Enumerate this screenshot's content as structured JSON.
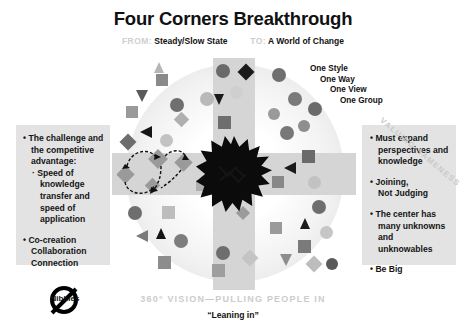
{
  "header": {
    "title": "Four Corners Breakthrough",
    "from_label": "FROM:",
    "from_value": "Steady/Slow State",
    "to_label": "TO:",
    "to_value": "A World of Change"
  },
  "left_panel": {
    "items": [
      {
        "bullet": "•",
        "lines": [
          "The challenge and",
          "the competitive",
          "advantage:"
        ],
        "sub_bullet": "·",
        "sub_lines": [
          "Speed of",
          "knowledge",
          "transfer and",
          "speed of",
          "application"
        ]
      },
      {
        "bullet": "•",
        "lines": [
          "Co-creation",
          "Collaboration",
          "Connection"
        ],
        "sub_bullet": "",
        "sub_lines": []
      }
    ]
  },
  "right_panel": {
    "items": [
      {
        "bullet": "•",
        "lines": [
          "Must expand",
          "perspectives and",
          "knowledge"
        ]
      },
      {
        "bullet": "•",
        "lines": [
          "Joining,",
          "Not Judging"
        ]
      },
      {
        "bullet": "•",
        "lines": [
          "The center has",
          "many unknowns",
          "and unknowables"
        ]
      },
      {
        "bullet": "•",
        "lines": [
          "Be Big"
        ]
      }
    ]
  },
  "diagram": {
    "diagonal_label": "VALUING SAMENESS",
    "one_list": [
      "One Style",
      "One Way",
      "One View",
      "One Group"
    ],
    "center_icon": "starburst-explosion",
    "arrow_count": 8,
    "arrow_direction": "inward"
  },
  "footer": {
    "main": "360° VISION—PULLING PEOPLE IN",
    "sub": "“Leaning in”"
  },
  "badge": {
    "label": "Nibbles",
    "icon": "no-entry-prohibition-icon"
  },
  "colors": {
    "panel_bg": "#e3e3e3",
    "band": "#d5d5d5",
    "muted_text": "#cccccc",
    "ink": "#111111",
    "shape_dark": "#555555",
    "shape_mid": "#888888",
    "shape_light": "#bbbbbb",
    "black": "#000000"
  },
  "shapes": [
    {
      "t": "sq",
      "x": 44,
      "y": 16,
      "s": 12,
      "c": "#8a8a8a"
    },
    {
      "t": "tri",
      "x": 24,
      "y": 32,
      "s": 12,
      "c": "#5a5a5a"
    },
    {
      "t": "ci",
      "x": 58,
      "y": 40,
      "s": 14,
      "c": "#6f6f6f"
    },
    {
      "t": "ci",
      "x": 88,
      "y": 34,
      "s": 14,
      "c": "#b9b9b9"
    },
    {
      "t": "dia",
      "x": 64,
      "y": 56,
      "s": 11,
      "c": "#b0b0b0"
    },
    {
      "t": "tri",
      "x": 28,
      "y": 68,
      "s": 12,
      "c": "#151515"
    },
    {
      "t": "dia",
      "x": 10,
      "y": 78,
      "s": 12,
      "c": "#6d6d6d"
    },
    {
      "t": "sq",
      "x": 14,
      "y": 48,
      "s": 12,
      "c": "#9a9a9a"
    },
    {
      "t": "ci",
      "x": 48,
      "y": 76,
      "s": 13,
      "c": "#c2c2c2"
    },
    {
      "t": "tri",
      "x": 42,
      "y": 4,
      "s": 11,
      "c": "#b6b6b6"
    },
    {
      "t": "ci",
      "x": 104,
      "y": 6,
      "s": 14,
      "c": "#6a6a6a"
    },
    {
      "t": "dia",
      "x": 128,
      "y": 8,
      "s": 12,
      "c": "#1a1a1a"
    },
    {
      "t": "tri",
      "x": 102,
      "y": 36,
      "s": 11,
      "c": "#1b1b1b"
    },
    {
      "t": "ci",
      "x": 118,
      "y": 28,
      "s": 13,
      "c": "#cfcfcf"
    },
    {
      "t": "sq",
      "x": 106,
      "y": 58,
      "s": 13,
      "c": "#6e6e6e"
    },
    {
      "t": "ci",
      "x": 160,
      "y": 10,
      "s": 14,
      "c": "#6f6f6f"
    },
    {
      "t": "ci",
      "x": 176,
      "y": 34,
      "s": 14,
      "c": "#7a7a7a"
    },
    {
      "t": "ci",
      "x": 196,
      "y": 44,
      "s": 14,
      "c": "#6a6a6a"
    },
    {
      "t": "ci",
      "x": 156,
      "y": 50,
      "s": 12,
      "c": "#9a9a9a"
    },
    {
      "t": "ci",
      "x": 186,
      "y": 62,
      "s": 12,
      "c": "#8e8e8e"
    },
    {
      "t": "ci",
      "x": 168,
      "y": 68,
      "s": 14,
      "c": "#787878"
    },
    {
      "t": "sq",
      "x": 190,
      "y": 92,
      "s": 13,
      "c": "#6a6a6a"
    },
    {
      "t": "tri",
      "x": 172,
      "y": 104,
      "s": 12,
      "c": "#1a1a1a"
    },
    {
      "t": "sq",
      "x": 160,
      "y": 118,
      "s": 12,
      "c": "#888888"
    },
    {
      "t": "ci",
      "x": 196,
      "y": 118,
      "s": 13,
      "c": "#c2c2c2"
    },
    {
      "t": "ci",
      "x": 200,
      "y": 142,
      "s": 14,
      "c": "#6e6e6e"
    },
    {
      "t": "tri",
      "x": 188,
      "y": 160,
      "s": 11,
      "c": "#1c1c1c"
    },
    {
      "t": "ci",
      "x": 208,
      "y": 168,
      "s": 13,
      "c": "#c6c6c6"
    },
    {
      "t": "sq",
      "x": 186,
      "y": 182,
      "s": 13,
      "c": "#7a7a7a"
    },
    {
      "t": "tri",
      "x": 168,
      "y": 196,
      "s": 12,
      "c": "#8d8d8d"
    },
    {
      "t": "dia",
      "x": 196,
      "y": 200,
      "s": 12,
      "c": "#bdbdbd"
    },
    {
      "t": "ci",
      "x": 214,
      "y": 200,
      "s": 12,
      "c": "#5a5a5a"
    },
    {
      "t": "sq",
      "x": 158,
      "y": 164,
      "s": 12,
      "c": "#9a9a9a"
    },
    {
      "t": "ci",
      "x": 16,
      "y": 148,
      "s": 14,
      "c": "#6e6e6e"
    },
    {
      "t": "sq",
      "x": 50,
      "y": 148,
      "s": 13,
      "c": "#bdbdbd"
    },
    {
      "t": "tri",
      "x": 24,
      "y": 172,
      "s": 12,
      "c": "#7a7a7a"
    },
    {
      "t": "tri",
      "x": 44,
      "y": 170,
      "s": 11,
      "c": "#151515"
    },
    {
      "t": "ci",
      "x": 62,
      "y": 176,
      "s": 14,
      "c": "#7d7d7d"
    },
    {
      "t": "sq",
      "x": 46,
      "y": 198,
      "s": 13,
      "c": "#8d8d8d"
    },
    {
      "t": "ci",
      "x": 104,
      "y": 188,
      "s": 14,
      "c": "#6e6e6e"
    },
    {
      "t": "sq",
      "x": 100,
      "y": 206,
      "s": 13,
      "c": "#9e9e9e"
    },
    {
      "t": "dia",
      "x": 132,
      "y": 194,
      "s": 12,
      "c": "#c4c4c4"
    },
    {
      "t": "dia",
      "x": 126,
      "y": 150,
      "s": 10,
      "c": "#9b9b9b"
    },
    {
      "t": "sq",
      "x": 84,
      "y": 122,
      "s": 11,
      "c": "#aeaeae"
    }
  ],
  "arrows": [
    {
      "angle": 0,
      "x": 74,
      "y": 108,
      "len": 30
    },
    {
      "angle": 45,
      "x": 54,
      "y": 66,
      "len": 30
    },
    {
      "angle": 90,
      "x": 104,
      "y": 44,
      "len": 28
    },
    {
      "angle": 135,
      "x": 152,
      "y": 62,
      "len": 30
    },
    {
      "angle": 180,
      "x": 166,
      "y": 108,
      "len": 28
    },
    {
      "angle": 225,
      "x": 152,
      "y": 150,
      "len": 30
    },
    {
      "angle": 270,
      "x": 104,
      "y": 168,
      "len": 32
    },
    {
      "angle": 315,
      "x": 56,
      "y": 150,
      "len": 30
    }
  ]
}
